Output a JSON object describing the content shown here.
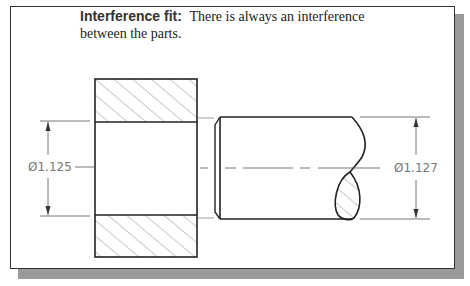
{
  "caption": {
    "term": "Interference fit:",
    "description": "There is always an interference",
    "description_line2": "between the parts."
  },
  "dimensions": {
    "hole_diameter": "Ø1.125",
    "shaft_diameter": "Ø1.127"
  },
  "colors": {
    "line": "#222222",
    "dimension": "#555555",
    "hatch": "#888888",
    "shadow": "#9a9a9a"
  }
}
